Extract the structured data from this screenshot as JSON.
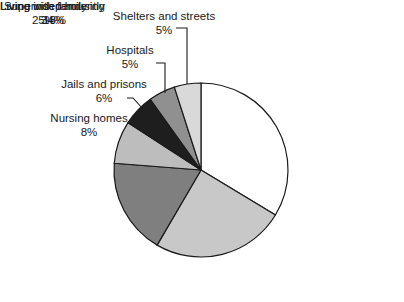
{
  "chart_data": {
    "type": "pie",
    "title": "",
    "subtitle": "",
    "xlabel": "",
    "ylabel": "",
    "legend_position": "none",
    "grid": false,
    "value_unit": "%",
    "categories": [
      "Living independently",
      "Living with family",
      "Supervised housing",
      "Nursing homes",
      "Jails and prisons",
      "Hospitals",
      "Shelters and streets"
    ],
    "values": [
      34,
      25,
      18,
      8,
      6,
      5,
      5
    ],
    "slices": [
      {
        "label": "Living independently",
        "value": 34,
        "value_text": "34%",
        "color": "#ffffff",
        "start_deg": 0,
        "end_deg": 122.4
      },
      {
        "label": "Living with family",
        "value": 25,
        "value_text": "25%",
        "color": "#c8c8c8",
        "start_deg": 122.4,
        "end_deg": 212.4
      },
      {
        "label": "Supervised housing",
        "value": 18,
        "value_text": "18%",
        "color": "#7f7f7f",
        "start_deg": 212.4,
        "end_deg": 277.2
      },
      {
        "label": "Nursing homes",
        "value": 8,
        "value_text": "8%",
        "color": "#bdbdbd",
        "start_deg": 277.2,
        "end_deg": 306.0
      },
      {
        "label": "Jails and prisons",
        "value": 6,
        "value_text": "6%",
        "color": "#1e1e1e",
        "start_deg": 306.0,
        "end_deg": 327.6
      },
      {
        "label": "Hospitals",
        "value": 5,
        "value_text": "5%",
        "color": "#909090",
        "start_deg": 327.6,
        "end_deg": 345.6
      },
      {
        "label": "Shelters and streets",
        "value": 5,
        "value_text": "5%",
        "color": "#d9d9d9",
        "start_deg": 345.6,
        "end_deg": 360.0
      }
    ],
    "total": 101,
    "stroke_color": "#1a1a1a"
  },
  "labels": {
    "shelters": {
      "category": "Shelters and streets",
      "value": "5%"
    },
    "hospitals": {
      "category": "Hospitals",
      "value": "5%"
    },
    "jails": {
      "category": "Jails and prisons",
      "value": "6%"
    },
    "nursing": {
      "category": "Nursing homes",
      "value": "8%"
    },
    "supervised": {
      "category": "Supervised housing",
      "value": "18%"
    },
    "independent": {
      "category": "Living independently",
      "value": "34%"
    },
    "family": {
      "category": "Living with family",
      "value": "25%"
    }
  }
}
